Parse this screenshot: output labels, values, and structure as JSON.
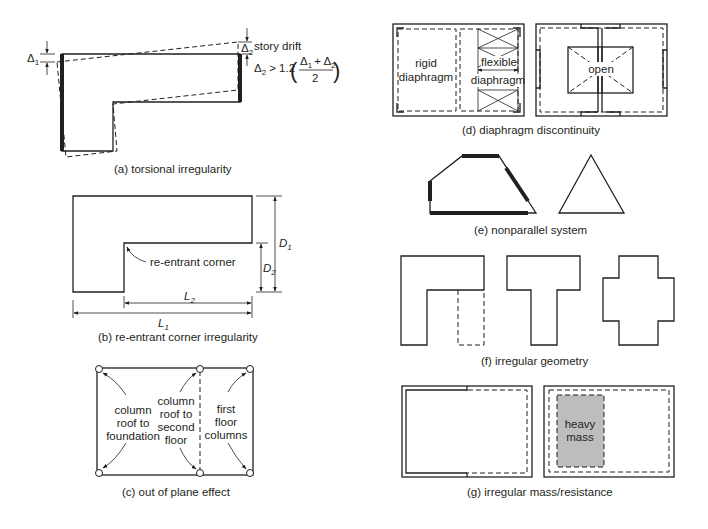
{
  "figure": {
    "panels": {
      "a": {
        "caption": "(a) torsional irregularity",
        "delta1_label": "Δ",
        "delta1_sub": "1",
        "delta2_label": "Δ",
        "delta2_sub": "2",
        "story_drift_label": "story drift",
        "formula_lhs": "Δ",
        "formula_lhs_sub": "2",
        "formula_op": "> 1.2",
        "formula_num": "Δ",
        "formula_num_sub1": "1",
        "formula_num_plus": "+ Δ",
        "formula_num_sub2": "2",
        "formula_den": "2"
      },
      "b": {
        "caption": "(b) re-entrant corner irregularity",
        "corner_label": "re-entrant corner",
        "D1": "D",
        "D1_sub": "1",
        "D2": "D",
        "D2_sub": "2",
        "L1": "L",
        "L1_sub": "1",
        "L2": "L",
        "L2_sub": "2"
      },
      "c": {
        "caption": "(c) out of plane effect",
        "left_label": [
          "column",
          "roof to",
          "foundation"
        ],
        "mid_label": [
          "column",
          "roof to",
          "second",
          "floor"
        ],
        "right_label": [
          "first",
          "floor",
          "columns"
        ]
      },
      "d": {
        "caption": "(d) diaphragm discontinuity",
        "rigid_label": [
          "rigid",
          "diaphragm"
        ],
        "flexible_label": [
          "flexible",
          "diaphragm"
        ],
        "open_label": "open"
      },
      "e": {
        "caption": "(e) nonparallel system"
      },
      "f": {
        "caption": "(f) irregular geometry"
      },
      "g": {
        "caption": "(g) irregular mass/resistance",
        "mass_label": [
          "heavy",
          "mass"
        ],
        "mass_fill": "#bdbdbd"
      }
    }
  }
}
